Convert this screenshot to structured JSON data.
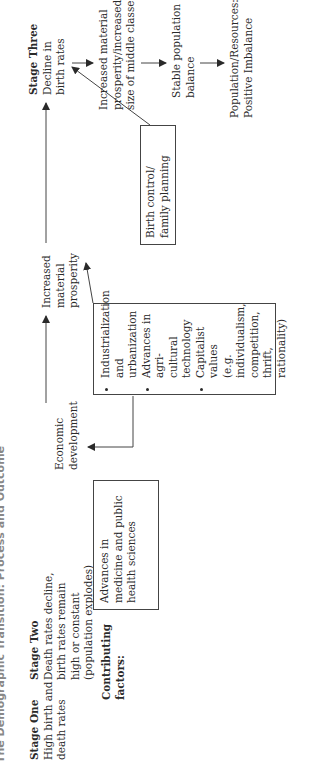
{
  "title": "The Demographic Transition: Process and Outcome",
  "stages": [
    {
      "heading": "Stage One",
      "lines": [
        "High birth and",
        "death rates"
      ]
    },
    {
      "heading": "Stage Two",
      "lines": [
        "Death rates decline,",
        "birth rates remain",
        "high or constant",
        "(population explodes)"
      ]
    },
    {
      "heading": "Stage Three",
      "lines": [
        "Decline in",
        "birth rates"
      ]
    }
  ],
  "flow": {
    "economic_development": [
      "Economic",
      "development"
    ],
    "increased_prosperity": [
      "Increased",
      "material",
      "prosperity"
    ]
  },
  "contributing_factors_label": [
    "Contributing",
    "factors:"
  ],
  "boxes": {
    "medicine": [
      "Advances in",
      "medicine and public",
      "health sciences"
    ],
    "industrial": [
      {
        "lines": [
          "Industrialization",
          "and urbanization"
        ]
      },
      {
        "lines": [
          "Advances in agri-",
          "cultural technology"
        ]
      },
      {
        "lines": [
          "Capitalist values",
          "(e.g. individualism,",
          "competition, thrift,",
          "rationality)"
        ]
      }
    ],
    "birth_control": [
      "Birth control/",
      "family planning"
    ]
  },
  "outcomes": [
    {
      "lines": [
        "Increased material",
        "prosperity/increased",
        "size of middle classes"
      ]
    },
    {
      "lines": [
        "Stable population",
        "balance"
      ]
    },
    {
      "lines": [
        "Population/Resources:",
        "Positive Imbalance"
      ]
    }
  ],
  "colors": {
    "ink": "#2a2a2a",
    "line": "#444444"
  }
}
